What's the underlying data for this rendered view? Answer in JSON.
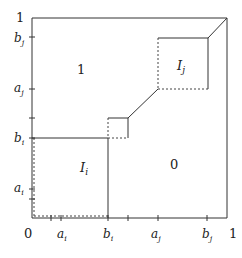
{
  "diagram": {
    "axis_labels": {
      "origin": "0",
      "x_one": "1",
      "y_one": "1",
      "x_ticks": [
        {
          "main": "a",
          "sub": "i"
        },
        {
          "main": "b",
          "sub": "i"
        },
        {
          "main": "a",
          "sub": "j"
        },
        {
          "main": "b",
          "sub": "j"
        }
      ],
      "y_ticks": [
        {
          "main": "a",
          "sub": "i"
        },
        {
          "main": "b",
          "sub": "i"
        },
        {
          "main": "a",
          "sub": "j"
        },
        {
          "main": "b",
          "sub": "j"
        }
      ]
    },
    "regions": {
      "upper": "1",
      "lower": "0",
      "box_i": {
        "main": "I",
        "sub": "i"
      },
      "box_j": {
        "main": "I",
        "sub": "j"
      }
    },
    "colors": {
      "line": "#333333",
      "background": "#ffffff"
    }
  }
}
